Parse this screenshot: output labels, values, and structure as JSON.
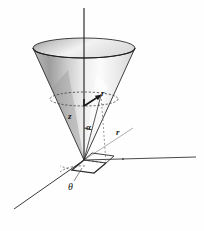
{
  "figure": {
    "caption": "",
    "background_color": "#fefefe",
    "ink_color": "#1a1a1a",
    "axes": {
      "z_axis": {
        "name": "vertical-axis",
        "from": [
          84,
          160
        ],
        "to": [
          84,
          8
        ]
      },
      "x_axis": {
        "name": "horizontal-right-axis",
        "from": [
          84,
          160
        ],
        "to": [
          196,
          157
        ]
      },
      "y_axis": {
        "name": "oblique-front-left-axis",
        "from": [
          84,
          160
        ],
        "to": [
          14,
          209
        ]
      }
    },
    "cone": {
      "apex": [
        84,
        160
      ],
      "rim_center": [
        84,
        48
      ],
      "rim_rx": 51,
      "rim_ry": 10,
      "fill_light": "#fcfcfc",
      "fill_mid": "#d8d8d8",
      "fill_dark": "#9a9a9a",
      "stroke": "#2b2b2b"
    },
    "cross_section": {
      "name": "dashed-circle",
      "center": [
        84,
        99
      ],
      "rx": 34,
      "ry": 7,
      "dash": "2 2"
    },
    "labels": {
      "z": "z",
      "alpha": "α",
      "r_radius": "r",
      "r_ground": "r",
      "theta": "θ"
    },
    "label_meanings": {
      "z": "height along vertical axis",
      "alpha": "half-angle of cone at apex",
      "r_radius": "radius of the horizontal circular cross-section",
      "r_ground": "radial distance in the ground plane",
      "theta": "azimuthal angle measured in the ground plane"
    }
  }
}
